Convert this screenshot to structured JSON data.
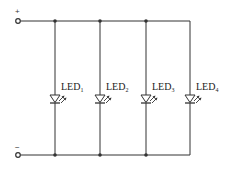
{
  "diagram": {
    "terminals": [
      {
        "id": "positive",
        "sign": "+",
        "x": 18,
        "y": 21
      },
      {
        "id": "negative",
        "sign": "−",
        "x": 18,
        "y": 155
      }
    ],
    "rails": {
      "top_y": 21,
      "bottom_y": 155,
      "left_x": 21,
      "right_x": 190
    },
    "leds": [
      {
        "label": "LED",
        "sub": "1",
        "x": 55
      },
      {
        "label": "LED",
        "sub": "2",
        "x": 100
      },
      {
        "label": "LED",
        "sub": "3",
        "x": 146
      },
      {
        "label": "LED",
        "sub": "4",
        "x": 190
      }
    ],
    "junctions_x": [
      55,
      100,
      146
    ],
    "line_color": "#333333"
  }
}
